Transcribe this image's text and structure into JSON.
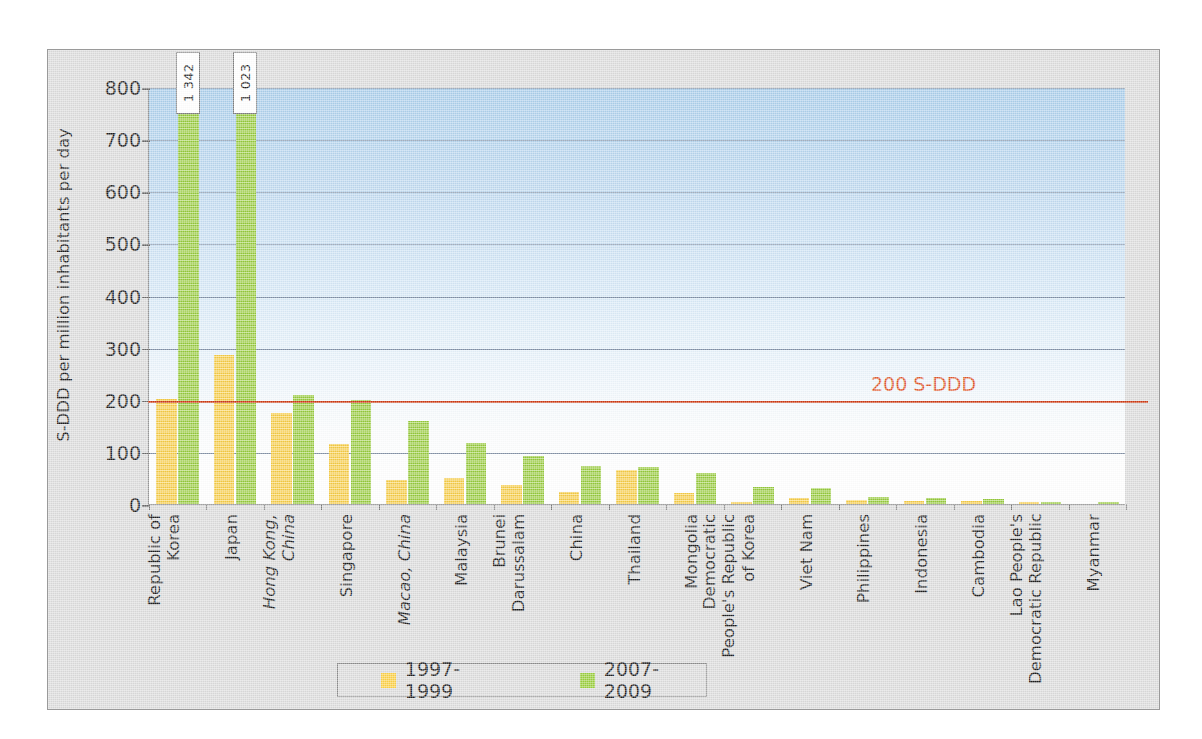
{
  "chart_data": {
    "type": "bar",
    "title": "",
    "xlabel": "",
    "ylabel": "S-DDD per million inhabitants per day",
    "ylim": [
      0,
      800
    ],
    "yticks": [
      0,
      100,
      200,
      300,
      400,
      500,
      600,
      700,
      800
    ],
    "ytick_labels": [
      "0",
      "100",
      "200",
      "300",
      "400",
      "500",
      "600",
      "700",
      "800"
    ],
    "grid": true,
    "legend_position": "bottom",
    "categories": [
      "Republic of Korea",
      "Japan",
      "Hong Kong, China",
      "Singapore",
      "Macao, China",
      "Malaysia",
      "Brunei Darussalam",
      "China",
      "Thailand",
      "Mongolia",
      "Democratic People's Republic of Korea",
      "Viet Nam",
      "Philippines",
      "Indonesia",
      "Cambodia",
      "Lao People's Democratic Republic",
      "Myanmar"
    ],
    "category_label_lines": [
      [
        "Republic of",
        "Korea"
      ],
      [
        "Japan"
      ],
      [
        "Hong Kong,",
        "China"
      ],
      [
        "Singapore"
      ],
      [
        "Macao, China"
      ],
      [
        "Malaysia"
      ],
      [
        "Brunei",
        "Darussalam"
      ],
      [
        "China"
      ],
      [
        "Thailand"
      ],
      [
        "Mongolia"
      ],
      [
        "Democratic",
        "People's Republic",
        "of Korea"
      ],
      [
        "Viet Nam"
      ],
      [
        "Philippines"
      ],
      [
        "Indonesia"
      ],
      [
        "Cambodia"
      ],
      [
        "Lao People's",
        "Democratic Republic"
      ],
      [
        "Myanmar"
      ]
    ],
    "category_italic": [
      false,
      false,
      true,
      false,
      true,
      false,
      false,
      false,
      false,
      false,
      false,
      false,
      false,
      false,
      false,
      false,
      false
    ],
    "series": [
      {
        "name": "1997-1999",
        "color": "#fcd046",
        "values": [
          202,
          286,
          175,
          115,
          47,
          49,
          36,
          23,
          66,
          21,
          1,
          12,
          7,
          6,
          5,
          1,
          0
        ]
      },
      {
        "name": "2007-2009",
        "color": "#9ace3d",
        "values": [
          1342,
          1023,
          210,
          200,
          160,
          118,
          92,
          72,
          71,
          59,
          33,
          31,
          14,
          12,
          9,
          2,
          1
        ]
      }
    ],
    "data_labels": [
      {
        "series": "2007-2009",
        "category": "Republic of Korea",
        "text": "1 342"
      },
      {
        "series": "2007-2009",
        "category": "Japan",
        "text": "1 023"
      }
    ],
    "annotations": [
      {
        "type": "reference-line",
        "value": 200,
        "label": "200 S-DDD",
        "color": "#cc3b14"
      }
    ],
    "legend": [
      {
        "label": "1997-1999",
        "color": "#fcd046"
      },
      {
        "label": "2007-2009",
        "color": "#9ace3d"
      }
    ]
  }
}
